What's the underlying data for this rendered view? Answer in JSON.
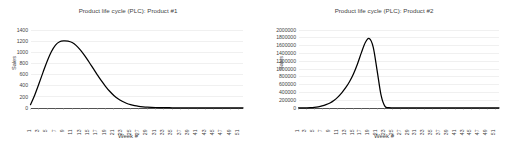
{
  "page": {
    "background_color": "#ffffff",
    "text_color": "#3f3f3f",
    "gridline_color": "#d9d9d9",
    "axis_color": "#3f3f3f",
    "series_color": "#000000"
  },
  "chart_data": [
    {
      "type": "line",
      "title": "Product life cycle (PLC): Product #1",
      "xlabel": "Week #",
      "ylabel": "Sales",
      "grid": true,
      "legend": "none",
      "xlim": [
        1,
        52
      ],
      "ylim": [
        0,
        1400
      ],
      "ytick_labels": [
        "0",
        "200",
        "400",
        "600",
        "800",
        "1000",
        "1200",
        "1400"
      ],
      "yticks": [
        0,
        200,
        400,
        600,
        800,
        1000,
        1200,
        1400
      ],
      "xtick_labels": [
        "1",
        "3",
        "5",
        "7",
        "9",
        "11",
        "13",
        "15",
        "17",
        "19",
        "21",
        "23",
        "25",
        "27",
        "29",
        "31",
        "33",
        "35",
        "37",
        "39",
        "41",
        "43",
        "45",
        "47",
        "49",
        "51"
      ],
      "x": [
        1,
        2,
        3,
        4,
        5,
        6,
        7,
        8,
        9,
        10,
        11,
        12,
        13,
        14,
        15,
        16,
        17,
        18,
        19,
        20,
        21,
        22,
        23,
        24,
        25,
        26,
        27,
        28,
        29,
        30,
        31,
        32,
        33,
        34,
        35,
        36,
        37,
        38,
        39,
        40,
        41,
        42,
        43,
        44,
        45,
        46,
        47,
        48,
        49,
        50,
        51,
        52
      ],
      "values": [
        60,
        230,
        430,
        640,
        840,
        1010,
        1130,
        1190,
        1205,
        1200,
        1175,
        1120,
        1040,
        940,
        830,
        715,
        600,
        490,
        390,
        300,
        225,
        165,
        120,
        85,
        60,
        42,
        30,
        22,
        16,
        12,
        9,
        7,
        6,
        5,
        4,
        4,
        3,
        3,
        3,
        2,
        2,
        2,
        2,
        2,
        2,
        2,
        2,
        2,
        2,
        2,
        2,
        2
      ]
    },
    {
      "type": "line",
      "title": "Product life cycle (PLC): Product #2",
      "xlabel": "Week #",
      "ylabel": "Sales",
      "grid": true,
      "legend": "none",
      "xlim": [
        1,
        52
      ],
      "ylim": [
        0,
        2000000
      ],
      "ytick_labels": [
        "0",
        "200000",
        "400000",
        "600000",
        "800000",
        "1000000",
        "1200000",
        "1400000",
        "1600000",
        "1800000",
        "2000000"
      ],
      "yticks": [
        0,
        200000,
        400000,
        600000,
        800000,
        1000000,
        1200000,
        1400000,
        1600000,
        1800000,
        2000000
      ],
      "xtick_labels": [
        "1",
        "3",
        "5",
        "7",
        "9",
        "11",
        "13",
        "15",
        "17",
        "19",
        "21",
        "23",
        "25",
        "27",
        "29",
        "31",
        "33",
        "35",
        "37",
        "39",
        "41",
        "43",
        "45",
        "47",
        "49",
        "51"
      ],
      "x": [
        1,
        2,
        3,
        4,
        5,
        6,
        7,
        8,
        9,
        10,
        11,
        12,
        13,
        14,
        15,
        16,
        17,
        18,
        19,
        20,
        21,
        22,
        23,
        24,
        25,
        26,
        27,
        28,
        29,
        30,
        31,
        32,
        33,
        34,
        35,
        36,
        37,
        38,
        39,
        40,
        41,
        42,
        43,
        44,
        45,
        46,
        47,
        48,
        49,
        50,
        51,
        52
      ],
      "values": [
        1000,
        2000,
        4000,
        8000,
        16000,
        30000,
        52000,
        85000,
        130000,
        195000,
        280000,
        390000,
        520000,
        680000,
        880000,
        1130000,
        1420000,
        1680000,
        1780000,
        1560000,
        960000,
        330000,
        40000,
        8000,
        4000,
        3000,
        3000,
        3000,
        3000,
        3000,
        3000,
        3000,
        3000,
        3000,
        3000,
        3000,
        3000,
        3000,
        3000,
        3000,
        3000,
        3000,
        3000,
        3000,
        3000,
        3000,
        3000,
        3000,
        3000,
        3000,
        3000,
        3000
      ]
    }
  ]
}
